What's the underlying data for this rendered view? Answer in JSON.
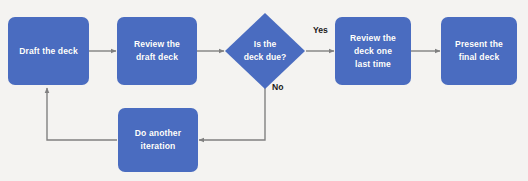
{
  "diagram": {
    "type": "flowchart",
    "colors": {
      "node_fill": "#4a6cc0",
      "node_text": "#ffffff",
      "connector": "#808080",
      "background": "#f4f3f1",
      "edge_label_text": "#1a1a1a"
    },
    "nodes": [
      {
        "id": "draft",
        "shape": "rounded-rectangle",
        "label": "Draft the deck"
      },
      {
        "id": "review_draft",
        "shape": "rounded-rectangle",
        "label": "Review the\ndraft deck"
      },
      {
        "id": "deck_due",
        "shape": "diamond",
        "label": "Is the\ndeck due?"
      },
      {
        "id": "review_last",
        "shape": "rounded-rectangle",
        "label": "Review the\ndeck one\nlast time"
      },
      {
        "id": "present",
        "shape": "rounded-rectangle",
        "label": "Present the\nfinal deck"
      },
      {
        "id": "iterate",
        "shape": "rounded-rectangle",
        "label": "Do another\niteration"
      }
    ],
    "edges": [
      {
        "from": "draft",
        "to": "review_draft",
        "label": ""
      },
      {
        "from": "review_draft",
        "to": "deck_due",
        "label": ""
      },
      {
        "from": "deck_due",
        "to": "review_last",
        "label": "Yes"
      },
      {
        "from": "review_last",
        "to": "present",
        "label": ""
      },
      {
        "from": "deck_due",
        "to": "iterate",
        "label": "No"
      },
      {
        "from": "iterate",
        "to": "draft",
        "label": ""
      }
    ],
    "edge_labels": {
      "yes": "Yes",
      "no": "No"
    }
  }
}
